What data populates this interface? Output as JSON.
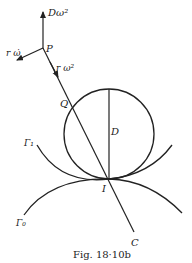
{
  "figure": {
    "caption": "Fig. 18·10b",
    "labels": {
      "D_omega2": "Dω²",
      "P": "P",
      "r_omega_dot": "r ω̇",
      "r_omega2": "r ω²",
      "Q": "Q",
      "D": "D",
      "Gamma1": "Γ₁",
      "Gamma0": "Γ₀",
      "I": "I",
      "C": "C"
    },
    "colors": {
      "ink": "#222222",
      "background": "#ffffff"
    }
  }
}
